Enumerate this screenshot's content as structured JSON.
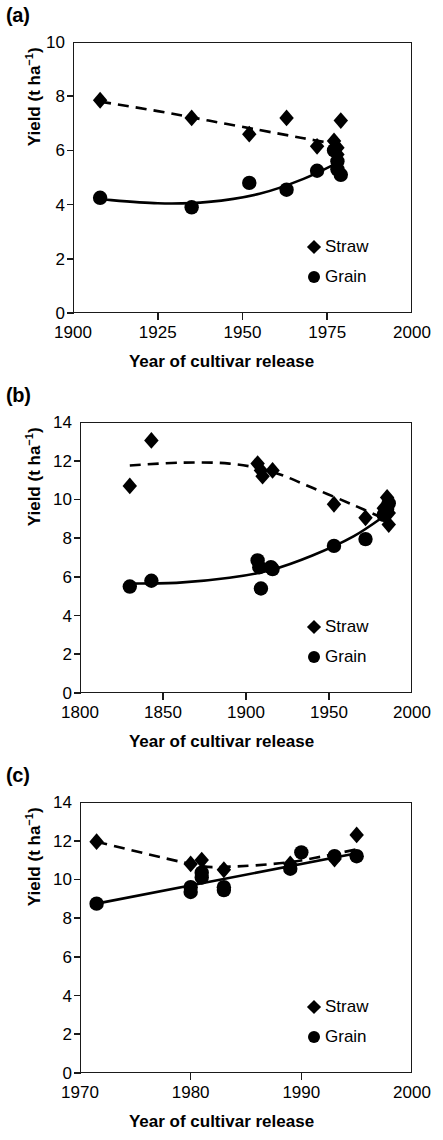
{
  "figure": {
    "panels": [
      {
        "label": "(a)",
        "xlabel": "Year of cultivar release",
        "ylabel_main": "Yield (t ha",
        "ylabel_sup": "−1",
        "ylabel_tail": ")",
        "xticks": [
          "1900",
          "1925",
          "1950",
          "1975",
          "2000"
        ],
        "yticks": [
          "0",
          "2",
          "4",
          "6",
          "8",
          "10"
        ],
        "legend": [
          {
            "marker": "diamond",
            "label": "Straw"
          },
          {
            "marker": "circle",
            "label": "Grain"
          }
        ]
      },
      {
        "label": "(b)",
        "xlabel": "Year of cultivar release",
        "ylabel_main": "Yield (t ha",
        "ylabel_sup": "−1",
        "ylabel_tail": ")",
        "xticks": [
          "1800",
          "1850",
          "1900",
          "1950",
          "2000"
        ],
        "yticks": [
          "0",
          "2",
          "4",
          "6",
          "8",
          "10",
          "12",
          "14"
        ],
        "legend": [
          {
            "marker": "diamond",
            "label": "Straw"
          },
          {
            "marker": "circle",
            "label": "Grain"
          }
        ]
      },
      {
        "label": "(c)",
        "xlabel": "Year of cultivar release",
        "ylabel_main": "Yield (t ha",
        "ylabel_sup": "−1",
        "ylabel_tail": ")",
        "xticks": [
          "1970",
          "1980",
          "1990",
          "2000"
        ],
        "yticks": [
          "0",
          "2",
          "4",
          "6",
          "8",
          "10",
          "12",
          "14"
        ],
        "legend": [
          {
            "marker": "diamond",
            "label": "Straw"
          },
          {
            "marker": "circle",
            "label": "Grain"
          }
        ]
      }
    ]
  },
  "chart_data": [
    {
      "type": "scatter",
      "panel": "(a)",
      "title": "",
      "xlabel": "Year of cultivar release",
      "ylabel": "Yield (t ha−1)",
      "xlim": [
        1900,
        2000
      ],
      "ylim": [
        0,
        10
      ],
      "xticks": [
        1900,
        1925,
        1950,
        1975,
        2000
      ],
      "yticks": [
        0,
        2,
        4,
        6,
        8,
        10
      ],
      "grid": false,
      "legend_position": "bottom-right",
      "series": [
        {
          "name": "Straw",
          "marker": "diamond",
          "line_style": "dashed",
          "points": [
            {
              "x": 1908,
              "y": 7.85
            },
            {
              "x": 1935,
              "y": 7.2
            },
            {
              "x": 1952,
              "y": 6.6
            },
            {
              "x": 1963,
              "y": 7.2
            },
            {
              "x": 1972,
              "y": 6.15
            },
            {
              "x": 1977,
              "y": 6.35
            },
            {
              "x": 1978,
              "y": 6.1
            },
            {
              "x": 1978,
              "y": 5.85
            },
            {
              "x": 1979,
              "y": 7.1
            }
          ],
          "fit_curve": [
            {
              "x": 1908,
              "y": 7.8
            },
            {
              "x": 1925,
              "y": 7.45
            },
            {
              "x": 1940,
              "y": 7.1
            },
            {
              "x": 1955,
              "y": 6.75
            },
            {
              "x": 1968,
              "y": 6.45
            },
            {
              "x": 1979,
              "y": 6.2
            }
          ]
        },
        {
          "name": "Grain",
          "marker": "circle",
          "line_style": "solid",
          "points": [
            {
              "x": 1908,
              "y": 4.25
            },
            {
              "x": 1935,
              "y": 3.9
            },
            {
              "x": 1952,
              "y": 4.8
            },
            {
              "x": 1963,
              "y": 4.55
            },
            {
              "x": 1972,
              "y": 5.25
            },
            {
              "x": 1977,
              "y": 6.0
            },
            {
              "x": 1978,
              "y": 5.6
            },
            {
              "x": 1978,
              "y": 5.3
            },
            {
              "x": 1979,
              "y": 5.1
            }
          ],
          "fit_curve": [
            {
              "x": 1908,
              "y": 4.2
            },
            {
              "x": 1925,
              "y": 4.05
            },
            {
              "x": 1940,
              "y": 4.1
            },
            {
              "x": 1955,
              "y": 4.4
            },
            {
              "x": 1968,
              "y": 4.95
            },
            {
              "x": 1979,
              "y": 5.6
            }
          ]
        }
      ]
    },
    {
      "type": "scatter",
      "panel": "(b)",
      "title": "",
      "xlabel": "Year of cultivar release",
      "ylabel": "Yield (t ha−1)",
      "xlim": [
        1800,
        2000
      ],
      "ylim": [
        0,
        14
      ],
      "xticks": [
        1800,
        1850,
        1900,
        1950,
        2000
      ],
      "yticks": [
        0,
        2,
        4,
        6,
        8,
        10,
        12,
        14
      ],
      "grid": false,
      "legend_position": "bottom-right",
      "series": [
        {
          "name": "Straw",
          "marker": "diamond",
          "line_style": "dashed",
          "points": [
            {
              "x": 1830,
              "y": 10.7
            },
            {
              "x": 1843,
              "y": 13.05
            },
            {
              "x": 1907,
              "y": 11.85
            },
            {
              "x": 1909,
              "y": 11.5
            },
            {
              "x": 1910,
              "y": 11.2
            },
            {
              "x": 1916,
              "y": 11.5
            },
            {
              "x": 1953,
              "y": 9.75
            },
            {
              "x": 1972,
              "y": 9.05
            },
            {
              "x": 1983,
              "y": 9.55
            },
            {
              "x": 1985,
              "y": 10.1
            },
            {
              "x": 1986,
              "y": 9.3
            },
            {
              "x": 1986,
              "y": 8.7
            }
          ],
          "fit_curve": [
            {
              "x": 1830,
              "y": 11.75
            },
            {
              "x": 1860,
              "y": 11.9
            },
            {
              "x": 1890,
              "y": 11.85
            },
            {
              "x": 1915,
              "y": 11.45
            },
            {
              "x": 1940,
              "y": 10.6
            },
            {
              "x": 1965,
              "y": 9.7
            },
            {
              "x": 1986,
              "y": 8.9
            }
          ]
        },
        {
          "name": "Grain",
          "marker": "circle",
          "line_style": "solid",
          "points": [
            {
              "x": 1830,
              "y": 5.5
            },
            {
              "x": 1843,
              "y": 5.8
            },
            {
              "x": 1907,
              "y": 6.85
            },
            {
              "x": 1908,
              "y": 6.5
            },
            {
              "x": 1909,
              "y": 5.4
            },
            {
              "x": 1915,
              "y": 6.5
            },
            {
              "x": 1916,
              "y": 6.4
            },
            {
              "x": 1953,
              "y": 7.6
            },
            {
              "x": 1972,
              "y": 7.95
            },
            {
              "x": 1983,
              "y": 9.2
            },
            {
              "x": 1985,
              "y": 9.5
            },
            {
              "x": 1986,
              "y": 9.8
            }
          ],
          "fit_curve": [
            {
              "x": 1830,
              "y": 5.65
            },
            {
              "x": 1860,
              "y": 5.7
            },
            {
              "x": 1890,
              "y": 5.95
            },
            {
              "x": 1915,
              "y": 6.35
            },
            {
              "x": 1940,
              "y": 7.1
            },
            {
              "x": 1965,
              "y": 8.1
            },
            {
              "x": 1986,
              "y": 9.3
            }
          ]
        }
      ]
    },
    {
      "type": "scatter",
      "panel": "(c)",
      "title": "",
      "xlabel": "Year of cultivar release",
      "ylabel": "Yield (t ha−1)",
      "xlim": [
        1970,
        2000
      ],
      "ylim": [
        0,
        14
      ],
      "xticks": [
        1970,
        1980,
        1990,
        2000
      ],
      "yticks": [
        0,
        2,
        4,
        6,
        8,
        10,
        12,
        14
      ],
      "grid": false,
      "legend_position": "bottom-right",
      "series": [
        {
          "name": "Straw",
          "marker": "diamond",
          "line_style": "dashed",
          "points": [
            {
              "x": 1971.5,
              "y": 11.95
            },
            {
              "x": 1980,
              "y": 10.8
            },
            {
              "x": 1981,
              "y": 11.0
            },
            {
              "x": 1983,
              "y": 10.5
            },
            {
              "x": 1989,
              "y": 10.8
            },
            {
              "x": 1993,
              "y": 11.05
            },
            {
              "x": 1995,
              "y": 12.3
            }
          ],
          "fit_curve": [
            {
              "x": 1971.5,
              "y": 11.95
            },
            {
              "x": 1980,
              "y": 10.8
            },
            {
              "x": 1983,
              "y": 10.65
            },
            {
              "x": 1989,
              "y": 10.9
            },
            {
              "x": 1995,
              "y": 11.55
            }
          ]
        },
        {
          "name": "Grain",
          "marker": "circle",
          "line_style": "solid",
          "points": [
            {
              "x": 1971.5,
              "y": 8.75
            },
            {
              "x": 1980,
              "y": 9.6
            },
            {
              "x": 1980,
              "y": 9.35
            },
            {
              "x": 1981,
              "y": 10.35
            },
            {
              "x": 1981,
              "y": 10.1
            },
            {
              "x": 1983,
              "y": 9.6
            },
            {
              "x": 1983,
              "y": 9.45
            },
            {
              "x": 1989,
              "y": 10.55
            },
            {
              "x": 1990,
              "y": 11.4
            },
            {
              "x": 1993,
              "y": 11.2
            },
            {
              "x": 1995,
              "y": 11.2
            }
          ],
          "fit_curve": [
            {
              "x": 1971.5,
              "y": 8.75
            },
            {
              "x": 1995,
              "y": 11.35
            }
          ]
        }
      ]
    }
  ]
}
